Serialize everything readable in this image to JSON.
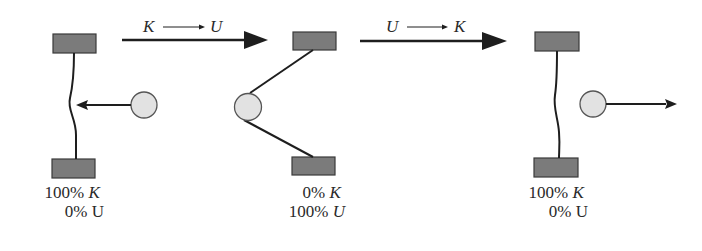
{
  "colors": {
    "block_fill": "#7b7b7b",
    "block_stroke": "#3a3a3a",
    "ball_fill": "#e2e2e2",
    "ball_stroke": "#555555",
    "line": "#1e1e1e",
    "text": "#2a2a2a"
  },
  "transitions": [
    {
      "from": "K",
      "arrow": "→",
      "to": "U"
    },
    {
      "from": "U",
      "arrow": "→",
      "to": "K"
    }
  ],
  "states": [
    {
      "line1_value": "100%",
      "line1_symbol": "K",
      "line2_value": "0%",
      "line2_symbol": "U",
      "ball_motion": "incoming"
    },
    {
      "line1_value": "0%",
      "line1_symbol": "K",
      "line2_value": "100%",
      "line2_symbol": "U",
      "ball_motion": "stretched"
    },
    {
      "line1_value": "100%",
      "line1_symbol": "K",
      "line2_value": "0%",
      "line2_symbol": "U",
      "ball_motion": "outgoing"
    }
  ]
}
